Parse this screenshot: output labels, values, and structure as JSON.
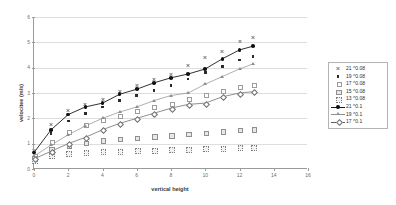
{
  "axes": {
    "y_label": "velocitee (m/s)",
    "x_label": "vertical height",
    "y_ticks": [
      "0",
      "1",
      "2",
      "3",
      "4",
      "5",
      "6"
    ],
    "x_ticks": [
      "0",
      "2",
      "4",
      "6",
      "8",
      "10",
      "12",
      "14",
      "16"
    ]
  },
  "legend": {
    "items": [
      {
        "label": "21 ^0.08",
        "marker": "cross-marker",
        "line": false
      },
      {
        "label": "19 ^0.08",
        "marker": "filled-square-marker",
        "line": false
      },
      {
        "label": "17 ^0.08",
        "marker": "open-square-marker",
        "line": false
      },
      {
        "label": "15 ^0.08",
        "marker": "grey-square-marker",
        "line": false
      },
      {
        "label": "13 ^0.08",
        "marker": "dotted-square-marker",
        "line": false
      },
      {
        "label": "21 ^0.1",
        "marker": "filled-circle-marker",
        "line": true
      },
      {
        "label": "19 ^0.1",
        "marker": "triangle-marker",
        "line": true
      },
      {
        "label": "17 ^0.1",
        "marker": "diamond-marker",
        "line": true
      }
    ]
  },
  "chart_data": {
    "type": "scatter",
    "title": "",
    "xlabel": "vertical height",
    "ylabel": "velocitee (m/s)",
    "xlim": [
      0,
      16
    ],
    "ylim": [
      0,
      6
    ],
    "xtick_step": 2,
    "ytick_step": 1,
    "grid": "horizontal",
    "legend_position": "right",
    "series": [
      {
        "name": "21 ^0.08",
        "marker": "cross-marker",
        "connected": false,
        "points": [
          [
            0.0,
            0.75
          ],
          [
            1.0,
            1.75
          ],
          [
            2.0,
            2.3
          ],
          [
            3.0,
            2.55
          ],
          [
            4.0,
            2.75
          ],
          [
            5.0,
            3.05
          ],
          [
            6.0,
            3.3
          ],
          [
            7.0,
            3.55
          ],
          [
            8.0,
            3.75
          ],
          [
            9.0,
            4.1
          ],
          [
            10.0,
            4.4
          ],
          [
            11.0,
            4.65
          ],
          [
            12.0,
            5.05
          ],
          [
            12.8,
            5.2
          ]
        ]
      },
      {
        "name": "19 ^0.08",
        "marker": "filled-square-marker",
        "connected": false,
        "points": [
          [
            0.0,
            0.6
          ],
          [
            1.0,
            1.4
          ],
          [
            2.0,
            1.9
          ],
          [
            3.0,
            2.2
          ],
          [
            4.0,
            2.45
          ],
          [
            5.0,
            2.7
          ],
          [
            6.0,
            2.9
          ],
          [
            7.0,
            3.1
          ],
          [
            8.0,
            3.3
          ],
          [
            9.0,
            3.55
          ],
          [
            10.0,
            3.8
          ],
          [
            11.0,
            4.05
          ],
          [
            12.0,
            4.3
          ],
          [
            12.8,
            4.45
          ]
        ]
      },
      {
        "name": "17 ^0.08",
        "marker": "open-square-marker",
        "connected": false,
        "points": [
          [
            0.0,
            0.55
          ],
          [
            1.0,
            1.1
          ],
          [
            2.0,
            1.5
          ],
          [
            3.0,
            1.75
          ],
          [
            4.0,
            1.95
          ],
          [
            5.0,
            2.1
          ],
          [
            6.0,
            2.3
          ],
          [
            7.0,
            2.45
          ],
          [
            8.0,
            2.6
          ],
          [
            9.0,
            2.8
          ],
          [
            10.0,
            2.95
          ],
          [
            11.0,
            3.1
          ],
          [
            12.0,
            3.25
          ],
          [
            12.8,
            3.35
          ]
        ]
      },
      {
        "name": "15 ^0.08",
        "marker": "grey-square-marker",
        "connected": false,
        "points": [
          [
            0.0,
            0.45
          ],
          [
            1.0,
            0.8
          ],
          [
            2.0,
            0.95
          ],
          [
            3.0,
            1.05
          ],
          [
            4.0,
            1.15
          ],
          [
            5.0,
            1.2
          ],
          [
            6.0,
            1.25
          ],
          [
            7.0,
            1.3
          ],
          [
            8.0,
            1.35
          ],
          [
            9.0,
            1.4
          ],
          [
            10.0,
            1.45
          ],
          [
            11.0,
            1.5
          ],
          [
            12.0,
            1.55
          ],
          [
            12.8,
            1.58
          ]
        ]
      },
      {
        "name": "13 ^0.08",
        "marker": "dotted-square-marker",
        "connected": false,
        "points": [
          [
            0.0,
            0.35
          ],
          [
            1.0,
            0.55
          ],
          [
            2.0,
            0.62
          ],
          [
            3.0,
            0.66
          ],
          [
            4.0,
            0.7
          ],
          [
            5.0,
            0.72
          ],
          [
            6.0,
            0.74
          ],
          [
            7.0,
            0.76
          ],
          [
            8.0,
            0.78
          ],
          [
            9.0,
            0.8
          ],
          [
            10.0,
            0.82
          ],
          [
            11.0,
            0.84
          ],
          [
            12.0,
            0.86
          ],
          [
            12.8,
            0.87
          ]
        ]
      },
      {
        "name": "21 ^0.1",
        "marker": "filled-circle-marker",
        "connected": true,
        "points": [
          [
            0.0,
            0.65
          ],
          [
            1.0,
            1.55
          ],
          [
            2.0,
            2.15
          ],
          [
            3.0,
            2.45
          ],
          [
            4.0,
            2.6
          ],
          [
            5.0,
            2.95
          ],
          [
            6.0,
            3.15
          ],
          [
            7.0,
            3.4
          ],
          [
            8.0,
            3.6
          ],
          [
            9.0,
            3.75
          ],
          [
            10.0,
            3.95
          ],
          [
            11.0,
            4.35
          ],
          [
            12.0,
            4.7
          ],
          [
            12.8,
            4.85
          ]
        ]
      },
      {
        "name": "19 ^0.1",
        "marker": "triangle-marker",
        "connected": true,
        "points": [
          [
            0.0,
            0.5
          ],
          [
            1.0,
            0.95
          ],
          [
            2.0,
            1.35
          ],
          [
            3.0,
            1.7
          ],
          [
            4.0,
            2.0
          ],
          [
            5.0,
            2.25
          ],
          [
            6.0,
            2.45
          ],
          [
            7.0,
            2.7
          ],
          [
            8.0,
            2.9
          ],
          [
            9.0,
            3.0
          ],
          [
            10.0,
            3.35
          ],
          [
            11.0,
            3.65
          ],
          [
            12.0,
            3.95
          ],
          [
            12.8,
            4.15
          ]
        ]
      },
      {
        "name": "17 ^0.1",
        "marker": "diamond-marker",
        "connected": true,
        "points": [
          [
            0.0,
            0.4
          ],
          [
            1.0,
            0.7
          ],
          [
            2.0,
            1.0
          ],
          [
            3.0,
            1.25
          ],
          [
            4.0,
            1.55
          ],
          [
            5.0,
            1.8
          ],
          [
            6.0,
            2.0
          ],
          [
            7.0,
            2.2
          ],
          [
            8.0,
            2.4
          ],
          [
            9.0,
            2.55
          ],
          [
            10.0,
            2.6
          ],
          [
            11.0,
            2.85
          ],
          [
            12.0,
            3.0
          ],
          [
            12.8,
            3.05
          ]
        ]
      }
    ]
  }
}
